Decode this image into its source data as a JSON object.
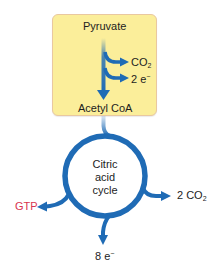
{
  "diagram": {
    "type": "metabolic-pathway",
    "box": {
      "top_label": "Pyruvate",
      "outputs": [
        {
          "text": "CO",
          "sub": "2"
        },
        {
          "text": "2 e",
          "sup": "−"
        }
      ],
      "bottom_label": "Acetyl CoA"
    },
    "cycle": {
      "line1": "Citric",
      "line2": "acid",
      "line3": "cycle"
    },
    "cycle_outputs": {
      "left": {
        "text": "GTP"
      },
      "right": {
        "text": "2 CO",
        "sub": "2"
      },
      "bottom": {
        "text": "8 e",
        "sup": "−"
      }
    },
    "colors": {
      "box_fill": "#fbee9a",
      "box_border": "#e9c8a0",
      "arrow_blue": "#1f6bb5",
      "gtp_red": "#d8344f",
      "text": "#1d1d1d"
    }
  }
}
